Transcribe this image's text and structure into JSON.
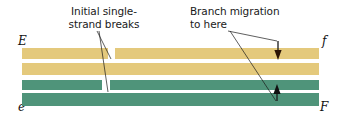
{
  "figure": {
    "annotations": {
      "initial_breaks": "Initial single-\nstrand breaks",
      "branch_migration": "Branch migration\nto here"
    },
    "end_labels": {
      "top_left": "E",
      "top_right": "f",
      "bottom_left": "e",
      "bottom_right": "F"
    },
    "colors": {
      "top_duplex": "#e4c97c",
      "bottom_duplex": "#4f947a",
      "background": "#ffffff",
      "ink": "#1a1a1a"
    },
    "features": {
      "nick_top_label": "single-strand break in top duplex",
      "nick_bottom_label": "single-strand break in bottom duplex",
      "arrow_top_label": "branch migration arrow pointing down",
      "arrow_bottom_label": "branch migration arrow pointing up"
    }
  }
}
